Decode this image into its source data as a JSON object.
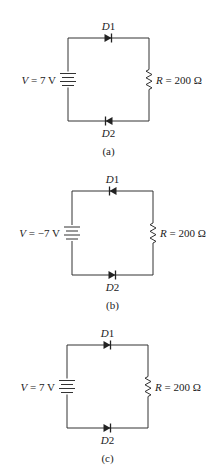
{
  "circuits": [
    {
      "id": "a",
      "caption": "(a)",
      "source_label": "V = 7 V",
      "source_var": "V",
      "source_value": " = 7 V",
      "resistor_var": "R",
      "resistor_value": " = 200 Ω",
      "d1_label": "D1",
      "d2_label": "D2",
      "d1_direction": "right",
      "d2_direction": "left",
      "origin": {
        "x": 68,
        "y": 38
      },
      "width": 81,
      "height": 83,
      "caption_y": 155
    },
    {
      "id": "b",
      "caption": "(b)",
      "source_label": "V = −7 V",
      "source_var": "V",
      "source_value": " = −7 V",
      "resistor_var": "R",
      "resistor_value": " = 200 Ω",
      "d1_label": "D1",
      "d2_label": "D2",
      "d1_direction": "left",
      "d2_direction": "right",
      "origin": {
        "x": 72,
        "y": 191
      },
      "width": 81,
      "height": 84,
      "caption_y": 309
    },
    {
      "id": "c",
      "caption": "(c)",
      "source_label": "V = 7 V",
      "source_var": "V",
      "source_value": " = 7 V",
      "resistor_var": "R",
      "resistor_value": " = 200 Ω",
      "d1_label": "D1",
      "d2_label": "D2",
      "d1_direction": "right",
      "d2_direction": "right",
      "origin": {
        "x": 67,
        "y": 345
      },
      "width": 81,
      "height": 83,
      "caption_y": 462
    }
  ],
  "colors": {
    "wire": "#333333",
    "text": "#222222",
    "background": "#ffffff"
  }
}
